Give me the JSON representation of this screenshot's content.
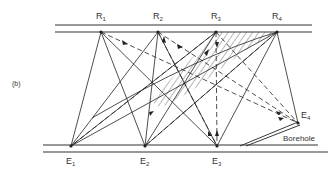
{
  "panel_label": "(b)",
  "receivers": [
    {
      "label": "R",
      "sub": "1",
      "x": 101,
      "y": 32
    },
    {
      "label": "R",
      "sub": "2",
      "x": 158,
      "y": 32
    },
    {
      "label": "R",
      "sub": "3",
      "x": 216,
      "y": 32
    },
    {
      "label": "R",
      "sub": "4",
      "x": 277,
      "y": 32
    }
  ],
  "emitters": [
    {
      "label": "E",
      "sub": "1",
      "x": 71,
      "y": 146
    },
    {
      "label": "E",
      "sub": "2",
      "x": 145,
      "y": 146
    },
    {
      "label": "E",
      "sub": "3",
      "x": 217,
      "y": 146
    },
    {
      "label": "E",
      "sub": "4",
      "x": 298,
      "y": 123
    }
  ],
  "borehole_label": "Borehole",
  "colors": {
    "line": "#222222",
    "background": "#ffffff"
  }
}
